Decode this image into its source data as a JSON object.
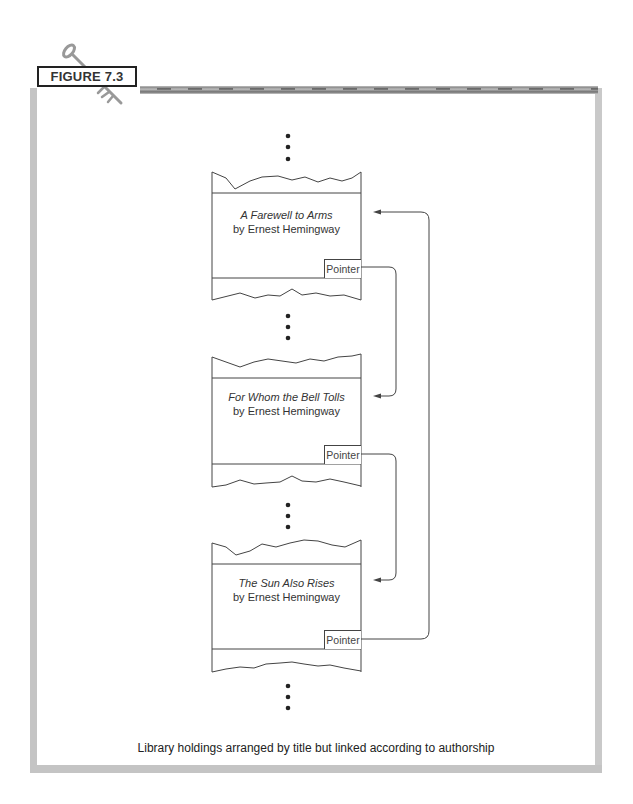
{
  "figure": {
    "label": "FIGURE 7.3",
    "caption": "Library holdings arranged by title but linked according to authorship"
  },
  "records": [
    {
      "title": "A Farewell to Arms",
      "author": "by Ernest Hemingway",
      "pointer_label": "Pointer"
    },
    {
      "title": "For Whom the Bell Tolls",
      "author": "by Ernest Hemingway",
      "pointer_label": "Pointer"
    },
    {
      "title": "The Sun Also Rises",
      "author": "by Ernest Hemingway",
      "pointer_label": "Pointer"
    }
  ],
  "links": [
    {
      "from": "A Farewell to Arms",
      "to": "For Whom the Bell Tolls"
    },
    {
      "from": "For Whom the Bell Tolls",
      "to": "The Sun Also Rises"
    },
    {
      "from": "The Sun Also Rises",
      "to": "A Farewell to Arms"
    }
  ],
  "colors": {
    "frame": "#c4c4c4",
    "line": "#444444",
    "text": "#333333"
  }
}
